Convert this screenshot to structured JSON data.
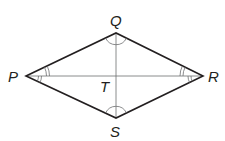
{
  "diagram": {
    "type": "rhombus",
    "vertices": {
      "P": {
        "label": "P",
        "x": 26,
        "y": 76
      },
      "Q": {
        "label": "Q",
        "x": 116,
        "y": 33
      },
      "R": {
        "label": "R",
        "x": 203,
        "y": 76
      },
      "S": {
        "label": "S",
        "x": 116,
        "y": 118
      }
    },
    "intersection": {
      "label": "T",
      "x": 116,
      "y": 76
    },
    "sides": [
      "PQ",
      "QR",
      "RS",
      "SP"
    ],
    "diagonals": [
      "PR",
      "QS"
    ],
    "angle_marks": {
      "P": "double arcs on both halves (angle QPT congruent to angle SPT)",
      "R": "double arcs on both halves (angle QRT congruent to angle SRT)",
      "Q": "single arc spanning angle PQR",
      "S": "single arc spanning angle PSR"
    },
    "colors": {
      "sides": "#231f20",
      "diagonals": "#6d6e70",
      "labels": "#231f20"
    }
  }
}
